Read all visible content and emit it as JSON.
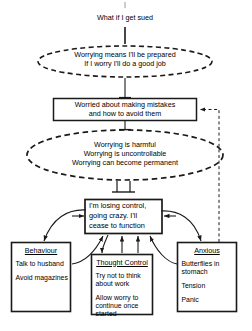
{
  "diagram": {
    "title_type": "cbt-worry-formulation",
    "trigger": {
      "label": "What if I get sued"
    },
    "positive_beliefs": {
      "line1": "Worrying means I'll be prepared",
      "line2": "If I worry I'll do a good job"
    },
    "worry_box": {
      "line1": "Worried about making mistakes",
      "line2": "and how to avoid them"
    },
    "negative_beliefs": {
      "line1": "Worrying is harmful",
      "line2": "Worrying is uncontrollable",
      "line3": "Worrying can become permanent"
    },
    "central_thought": {
      "line1": "I'm losing control,",
      "line2": "going crazy.  I'll",
      "line3": "cease to function"
    },
    "behaviour": {
      "title": "Behaviour",
      "item1": "Talk to husband",
      "item2": "Avoid magazines"
    },
    "thought_control": {
      "title": "Thought Control",
      "item1": "Try not to think about work",
      "item2": "Allow worry to continue once started"
    },
    "anxious": {
      "title": "Anxious",
      "item1": "Butterflies in stomach",
      "item2": "Tension",
      "item3": "Panic"
    },
    "colors": {
      "stroke": "#1a1a1a",
      "background": "#ffffff",
      "text": "#000000"
    }
  }
}
